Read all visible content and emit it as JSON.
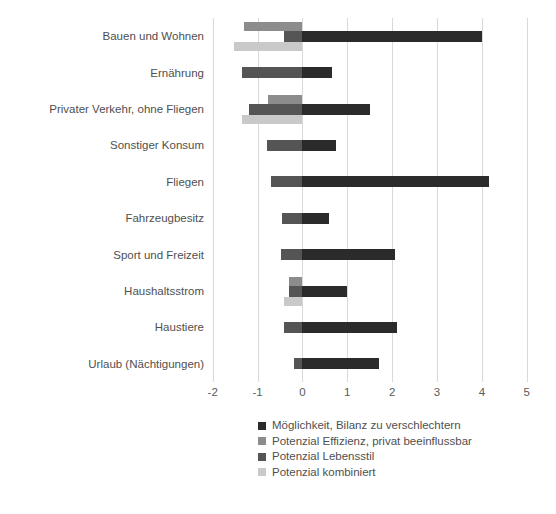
{
  "chart_data": {
    "type": "bar",
    "orientation": "horizontal",
    "title": "",
    "xlabel": "",
    "ylabel": "",
    "xlim": [
      -2,
      5
    ],
    "xticks": [
      "-2",
      "-1",
      "0",
      "1",
      "2",
      "3",
      "4",
      "5"
    ],
    "grid": true,
    "legend_position": "bottom",
    "categories": [
      "Bauen und Wohnen",
      "Ernährung",
      "Privater Verkehr, ohne Fliegen",
      "Sonstiger Konsum",
      "Fliegen",
      "Fahrzeugbesitz",
      "Sport und Freizeit",
      "Haushaltsstrom",
      "Haustiere",
      "Urlaub (Nächtigungen)"
    ],
    "series": [
      {
        "name": "Möglichkeit, Bilanz zu verschlechtern",
        "color": "#2b2b2b",
        "values": [
          4.0,
          0.65,
          1.5,
          0.75,
          4.15,
          0.6,
          2.07,
          1.0,
          2.1,
          1.7
        ]
      },
      {
        "name": "Potenzial Effizienz, privat beeinflussbar",
        "color": "#8c8c8c",
        "values": [
          -1.3,
          null,
          -0.77,
          null,
          null,
          null,
          null,
          -0.3,
          null,
          null
        ]
      },
      {
        "name": "Potenzial Lebensstil",
        "color": "#555555",
        "values": [
          -0.4,
          -1.34,
          -1.2,
          -0.8,
          -0.71,
          -0.45,
          -0.47,
          -0.3,
          -0.42,
          -0.18
        ]
      },
      {
        "name": "Potenzial kombiniert",
        "color": "#c9c9c9",
        "values": [
          -1.52,
          null,
          -1.35,
          null,
          null,
          null,
          null,
          -0.4,
          null,
          null
        ]
      }
    ]
  },
  "legend": {
    "items": [
      {
        "label": "Möglichkeit, Bilanz zu verschlechtern",
        "color": "#2b2b2b"
      },
      {
        "label": "Potenzial Effizienz, privat beeinflussbar",
        "color": "#8c8c8c"
      },
      {
        "label": "Potenzial Lebensstil",
        "color": "#555555"
      },
      {
        "label": "Potenzial kombiniert",
        "color": "#c9c9c9"
      }
    ]
  }
}
